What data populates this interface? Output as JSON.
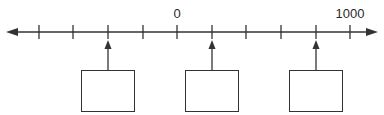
{
  "diagram": {
    "type": "number-line",
    "colors": {
      "line": "#333333",
      "background": "#ffffff",
      "text": "#2a2a2a"
    },
    "axis": {
      "y": 32,
      "x_start": 6,
      "x_end": 378,
      "arrow_left": true,
      "arrow_right": true
    },
    "ticks": [
      {
        "x": 39,
        "value": -800,
        "label": ""
      },
      {
        "x": 73,
        "value": -600,
        "label": ""
      },
      {
        "x": 108,
        "value": -400,
        "label": ""
      },
      {
        "x": 143,
        "value": -200,
        "label": ""
      },
      {
        "x": 177,
        "value": 0,
        "label": "0"
      },
      {
        "x": 212,
        "value": 200,
        "label": ""
      },
      {
        "x": 246,
        "value": 400,
        "label": ""
      },
      {
        "x": 281,
        "value": 600,
        "label": ""
      },
      {
        "x": 316,
        "value": 800,
        "label": ""
      },
      {
        "x": 350,
        "value": 1000,
        "label": "1000"
      }
    ],
    "pointers": [
      {
        "x": 108,
        "box": {
          "left": 81,
          "top": 70,
          "width": 54,
          "height": 42
        },
        "answer": ""
      },
      {
        "x": 212,
        "box": {
          "left": 185,
          "top": 70,
          "width": 54,
          "height": 42
        },
        "answer": ""
      },
      {
        "x": 316,
        "box": {
          "left": 289,
          "top": 70,
          "width": 54,
          "height": 42
        },
        "answer": ""
      }
    ]
  }
}
